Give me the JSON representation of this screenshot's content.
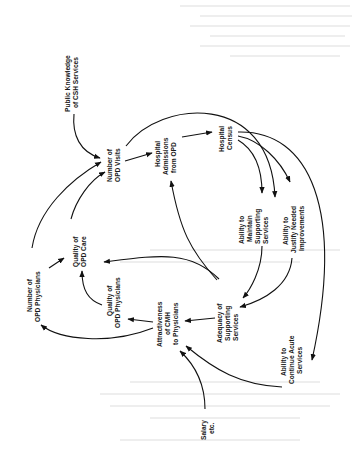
{
  "diagram": {
    "type": "causal-loop",
    "orientation": "rotated-90-ccw",
    "nodes": [
      {
        "id": "public_knowledge",
        "lines": [
          "Public Knowledge",
          "of CSH Services"
        ]
      },
      {
        "id": "opd_visits",
        "lines": [
          "Number of",
          "OPD Visits"
        ]
      },
      {
        "id": "admissions",
        "lines": [
          "Hospital",
          "Admissions",
          "from OPD"
        ]
      },
      {
        "id": "census",
        "lines": [
          "Hospital",
          "Census"
        ]
      },
      {
        "id": "maintain",
        "lines": [
          "Ability to",
          "Maintain",
          "Supporting",
          "Services"
        ]
      },
      {
        "id": "justify",
        "lines": [
          "Ability to",
          "Justify Needed",
          "Improvements"
        ]
      },
      {
        "id": "acute",
        "lines": [
          "Ability to",
          "Continue Acute",
          "Services"
        ]
      },
      {
        "id": "adequacy",
        "lines": [
          "Adequacy of",
          "Supporting",
          "Services"
        ]
      },
      {
        "id": "attractiveness",
        "lines": [
          "Attractiveness",
          "of CMH",
          "to Physicians"
        ]
      },
      {
        "id": "quality_physicians",
        "lines": [
          "Quality of",
          "OPD Physicians"
        ]
      },
      {
        "id": "quality_care",
        "lines": [
          "Quality of",
          "OPD Care"
        ]
      },
      {
        "id": "num_physicians",
        "lines": [
          "Number of",
          "OPD Physicians"
        ]
      },
      {
        "id": "salary",
        "lines": [
          "Salary",
          "etc."
        ]
      }
    ],
    "edges": [
      {
        "from": "public_knowledge",
        "to": "opd_visits"
      },
      {
        "from": "opd_visits",
        "to": "admissions"
      },
      {
        "from": "opd_visits",
        "to": "justify"
      },
      {
        "from": "admissions",
        "to": "census"
      },
      {
        "from": "census",
        "to": "maintain"
      },
      {
        "from": "census",
        "to": "justify"
      },
      {
        "from": "census",
        "to": "acute"
      },
      {
        "from": "maintain",
        "to": "adequacy"
      },
      {
        "from": "justify",
        "to": "adequacy"
      },
      {
        "from": "adequacy",
        "to": "attractiveness"
      },
      {
        "from": "adequacy",
        "to": "quality_care"
      },
      {
        "from": "adequacy",
        "to": "admissions"
      },
      {
        "from": "attractiveness",
        "to": "quality_physicians"
      },
      {
        "from": "attractiveness",
        "to": "num_physicians"
      },
      {
        "from": "quality_physicians",
        "to": "quality_care"
      },
      {
        "from": "quality_care",
        "to": "opd_visits"
      },
      {
        "from": "num_physicians",
        "to": "quality_care"
      },
      {
        "from": "num_physicians",
        "to": "opd_visits"
      },
      {
        "from": "acute",
        "to": "attractiveness"
      },
      {
        "from": "salary",
        "to": "attractiveness"
      }
    ]
  }
}
